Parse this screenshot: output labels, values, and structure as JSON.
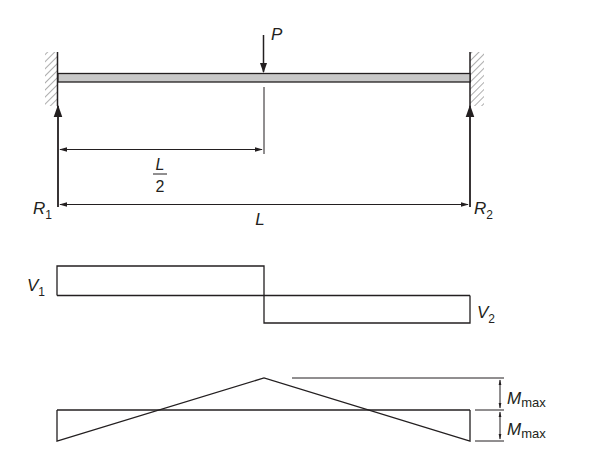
{
  "colors": {
    "ink": "#231f20",
    "beam_fill": "#c8c8c8",
    "background": "#ffffff"
  },
  "load": {
    "label": "P"
  },
  "reactions": {
    "left": {
      "label": "R",
      "subscript": "1"
    },
    "right": {
      "label": "R",
      "subscript": "2"
    }
  },
  "dimensions": {
    "half_span": {
      "numerator": "L",
      "denominator": "2"
    },
    "span": {
      "label": "L"
    }
  },
  "shear_diagram": {
    "left": {
      "label": "V",
      "subscript": "1"
    },
    "right": {
      "label": "V",
      "subscript": "2"
    }
  },
  "moment_diagram": {
    "upper": {
      "label": "M",
      "subscript": "max"
    },
    "lower": {
      "label": "M",
      "subscript": "max"
    }
  }
}
